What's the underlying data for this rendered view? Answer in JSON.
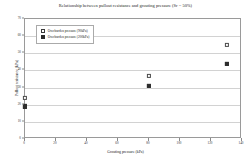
{
  "chart_data": {
    "type": "scatter",
    "title": "Relationship between pullout resistance and grouting pressure (Sr = 50%)",
    "xlabel": "Grouting pressure (kPa)",
    "ylabel": "Pullout resistance (kPa)",
    "xlim": [
      0,
      140
    ],
    "ylim": [
      0,
      70
    ],
    "xticks": [
      0,
      20,
      40,
      60,
      80,
      100,
      120,
      140
    ],
    "yticks": [
      0,
      10,
      20,
      30,
      40,
      50,
      60,
      70
    ],
    "grid": "horizontal",
    "legend_position": "upper-left-inside",
    "series": [
      {
        "name": "Overburden pressure (90kPa)",
        "marker": "open-square",
        "color": "#ffffff",
        "edge_color": "#4a4a4a",
        "points": [
          {
            "x": 0,
            "y": 24
          },
          {
            "x": 80,
            "y": 37
          },
          {
            "x": 130,
            "y": 55
          }
        ]
      },
      {
        "name": "Overburden pressure (200kPa)",
        "marker": "filled-square",
        "color": "#2e2e2e",
        "edge_color": "#2e2e2e",
        "points": [
          {
            "x": 0,
            "y": 19
          },
          {
            "x": 80,
            "y": 31
          },
          {
            "x": 130,
            "y": 44
          }
        ]
      }
    ]
  }
}
